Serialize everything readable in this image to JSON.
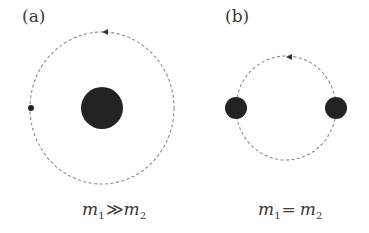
{
  "panels": [
    {
      "label": "(a)",
      "formula": {
        "m1": "m",
        "sub1": "1",
        "op": "≫",
        "m2": "m",
        "sub2": "2"
      },
      "caption": "m₁≫m₂",
      "orbit": {
        "cx": 102,
        "cy": 108,
        "rx": 72,
        "ry": 76,
        "style": "dashed",
        "direction": "counter-clockwise"
      },
      "bodies": [
        {
          "name": "heavy-mass",
          "cx": 102,
          "cy": 108,
          "r": 21
        },
        {
          "name": "light-mass",
          "cx": 31,
          "cy": 108,
          "r": 3
        }
      ]
    },
    {
      "label": "(b)",
      "formula": {
        "m1": "m",
        "sub1": "1",
        "op": "=",
        "m2": "m",
        "sub2": "2"
      },
      "caption": "m₁= m₂",
      "orbit": {
        "cx": 286,
        "cy": 108,
        "rx": 50,
        "ry": 52,
        "style": "dashed",
        "direction": "counter-clockwise"
      },
      "bodies": [
        {
          "name": "mass-1",
          "cx": 236,
          "cy": 108,
          "r": 11
        },
        {
          "name": "mass-2",
          "cx": 336,
          "cy": 108,
          "r": 11
        }
      ]
    }
  ],
  "colors": {
    "mass": "#232323",
    "orbit": "#8a8a8a",
    "text": "#3a3a3a",
    "background": "#ffffff"
  }
}
